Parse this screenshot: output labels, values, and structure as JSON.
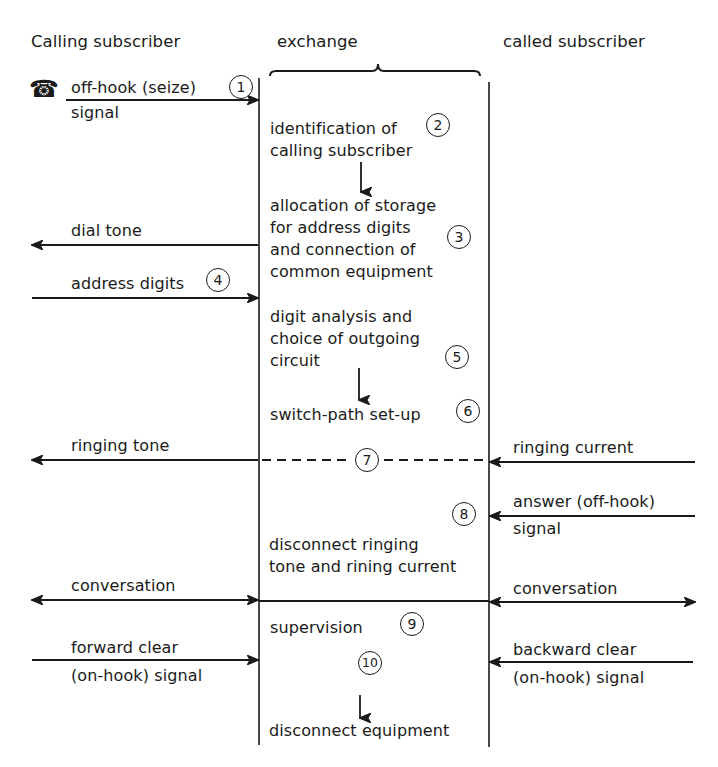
{
  "headers": {
    "calling": "Calling subscriber",
    "exchange": "exchange",
    "called": "called subscriber"
  },
  "icons": {
    "telephone": "☎"
  },
  "left_signals": [
    {
      "id": "off-hook",
      "line1": "off-hook (seize)",
      "line2": "signal",
      "direction": "to-exchange",
      "step": "1"
    },
    {
      "id": "dial-tone",
      "line1": "dial tone",
      "direction": "from-exchange"
    },
    {
      "id": "address-digits",
      "line1": "address digits",
      "direction": "to-exchange",
      "step": "4"
    },
    {
      "id": "ringing-tone",
      "line1": "ringing tone",
      "direction": "from-exchange"
    },
    {
      "id": "conversation-left",
      "line1": "conversation",
      "direction": "bidirectional"
    },
    {
      "id": "forward-clear",
      "line1": "forward clear",
      "line2": "(on-hook) signal",
      "direction": "to-exchange"
    }
  ],
  "exchange_steps": [
    {
      "step": "2",
      "lines": [
        "identification of",
        "calling subscriber"
      ]
    },
    {
      "step": "3",
      "lines": [
        "allocation of storage",
        "for address digits",
        "and connection of",
        "common equipment"
      ]
    },
    {
      "step": "5",
      "lines": [
        "digit analysis and",
        "choice of outgoing",
        "circuit"
      ]
    },
    {
      "step": "6",
      "lines": [
        "switch-path set-up"
      ]
    },
    {
      "step": "7",
      "lines": []
    },
    {
      "step": "8",
      "lines": [
        "disconnect ringing",
        "tone and rining current"
      ]
    },
    {
      "step": "9",
      "lines": [
        "supervision"
      ]
    },
    {
      "step": "10",
      "lines": [
        "disconnect equipment"
      ]
    }
  ],
  "right_signals": [
    {
      "id": "ringing-current",
      "line1": "ringing current",
      "direction": "from-exchange"
    },
    {
      "id": "answer",
      "line1": "answer (off-hook)",
      "line2": "signal",
      "direction": "to-exchange"
    },
    {
      "id": "conversation-right",
      "line1": "conversation",
      "direction": "bidirectional"
    },
    {
      "id": "backward-clear",
      "line1": "backward clear",
      "line2": "(on-hook) signal",
      "direction": "to-exchange"
    }
  ],
  "colors": {
    "ink": "#1a1a1a",
    "background": "#ffffff"
  }
}
